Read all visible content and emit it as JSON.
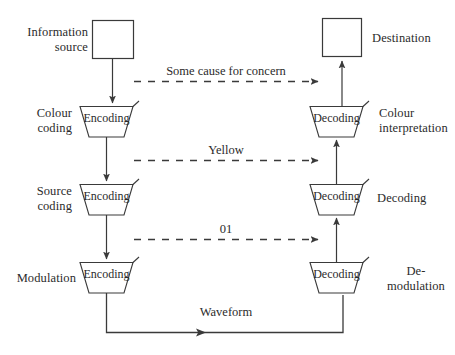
{
  "diagram": {
    "stroke_color": "#3a3a3a",
    "text_color": "#2b2b2b",
    "background": "#ffffff",
    "left_labels": [
      {
        "id": "information-source",
        "text": "Information\nsource"
      },
      {
        "id": "colour-coding",
        "text": "Colour\ncoding"
      },
      {
        "id": "source-coding",
        "text": "Source\ncoding"
      },
      {
        "id": "modulation",
        "text": "Modulation"
      }
    ],
    "right_labels": [
      {
        "id": "destination",
        "text": "Destination"
      },
      {
        "id": "colour-interpretation",
        "text": "Colour\ninterpretation"
      },
      {
        "id": "decoding-stage",
        "text": "Decoding"
      },
      {
        "id": "de-modulation",
        "text": "De-\nmodulation"
      }
    ],
    "left_nodes": [
      {
        "id": "source-box",
        "shape": "square",
        "text": ""
      },
      {
        "id": "encoding-1",
        "shape": "trapezoid",
        "text": "Encoding"
      },
      {
        "id": "encoding-2",
        "shape": "trapezoid",
        "text": "Encoding"
      },
      {
        "id": "encoding-3",
        "shape": "trapezoid",
        "text": "Encoding"
      }
    ],
    "right_nodes": [
      {
        "id": "destination-box",
        "shape": "square",
        "text": ""
      },
      {
        "id": "decoding-1",
        "shape": "trapezoid",
        "text": "Decoding"
      },
      {
        "id": "decoding-2",
        "shape": "trapezoid",
        "text": "Decoding"
      },
      {
        "id": "decoding-3",
        "shape": "trapezoid",
        "text": "Decoding"
      }
    ],
    "channel_links": [
      {
        "id": "link-concern",
        "text": "Some cause for concern",
        "style": "dashed",
        "direction": "left-to-right"
      },
      {
        "id": "link-yellow",
        "text": "Yellow",
        "style": "dashed",
        "direction": "left-to-right"
      },
      {
        "id": "link-binary",
        "text": "01",
        "style": "dashed",
        "direction": "left-to-right"
      },
      {
        "id": "link-waveform",
        "text": "Waveform",
        "style": "solid",
        "direction": "left-to-right"
      }
    ]
  }
}
